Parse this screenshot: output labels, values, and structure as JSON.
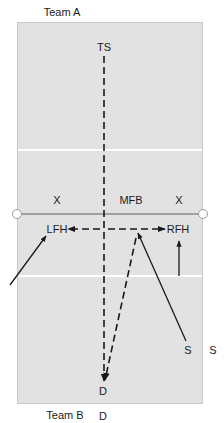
{
  "diagram": {
    "title_top": "Team A",
    "title_bottom": "Team B",
    "colors": {
      "court_fill": "#e2e2e2",
      "court_border": "#c8c8c8",
      "court_lines": "#ffffff",
      "net_line": "#8a8a8a",
      "line_color": "#1a1a1a",
      "text": "#1a1a1a"
    },
    "labels": {
      "ts": "TS",
      "x_left": "X",
      "mfb": "MFB",
      "x_right": "X",
      "lfh": "LFH",
      "rfh": "RFH",
      "s_inner": "S",
      "s_outer": "S",
      "d_inner": "D",
      "d_outer": "D"
    },
    "court": {
      "left": 17,
      "top": 22,
      "right": 203,
      "bottom": 404,
      "attack_line_top_y": 150,
      "net_y": 214,
      "attack_line_bottom_y": 276
    },
    "paths": [
      {
        "id": "ts-to-d",
        "style": "dashed",
        "from": [
          104,
          56
        ],
        "to": [
          104,
          381
        ],
        "arrow": "end"
      },
      {
        "id": "center-to-lfh",
        "style": "dashed",
        "from": [
          104,
          229
        ],
        "to": [
          67,
          229
        ],
        "arrow": "end"
      },
      {
        "id": "center-to-rfh",
        "style": "dashed",
        "from": [
          104,
          229
        ],
        "to": [
          165,
          229
        ],
        "arrow": "end"
      },
      {
        "id": "apex-to-d",
        "style": "dashed",
        "from": [
          138,
          233
        ],
        "to": [
          104,
          381
        ],
        "arrow": "end"
      },
      {
        "id": "s-to-apex",
        "style": "solid",
        "from": [
          186,
          341
        ],
        "to": [
          138,
          232
        ],
        "arrow": "end"
      },
      {
        "id": "outside-to-lfh",
        "style": "solid",
        "from": [
          10,
          285
        ],
        "to": [
          46,
          236
        ],
        "arrow": "end"
      },
      {
        "id": "rfh-approach",
        "style": "solid",
        "from": [
          179,
          276
        ],
        "to": [
          179,
          241
        ],
        "arrow": "end"
      }
    ]
  }
}
